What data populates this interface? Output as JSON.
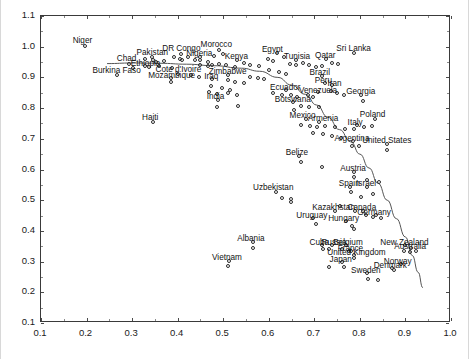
{
  "chart_data": {
    "type": "scatter",
    "title": "",
    "xlabel": "",
    "ylabel": "",
    "xlim": [
      0.1,
      1.0
    ],
    "ylim": [
      0.1,
      1.1
    ],
    "xticks": [
      0.1,
      0.2,
      0.3,
      0.4,
      0.5,
      0.6,
      0.7,
      0.8,
      0.9,
      1.0
    ],
    "xtick_labels": [
      "0.1",
      "0.2",
      "0.3",
      "0.4",
      "0.5",
      "0.6",
      "0.7",
      "0.8",
      "0.9",
      "1.0"
    ],
    "yticks": [
      0.1,
      0.2,
      0.3,
      0.4,
      0.5,
      0.6,
      0.7,
      0.8,
      0.9,
      1.0,
      1.1
    ],
    "ytick_labels": [
      "0.1",
      "0.2",
      "0.3",
      "0.4",
      "0.5",
      "0.6",
      "0.7",
      "0.8",
      "0.9",
      "1.0",
      "1.1"
    ],
    "grid": false,
    "legend": false,
    "marker": "open-circle",
    "marker_color": "#2b2b2b",
    "trend_line": {
      "present": true,
      "color": "#555555",
      "style": "smooth-loess",
      "points": [
        [
          0.245,
          0.945
        ],
        [
          0.3,
          0.947
        ],
        [
          0.36,
          0.946
        ],
        [
          0.42,
          0.943
        ],
        [
          0.48,
          0.938
        ],
        [
          0.54,
          0.93
        ],
        [
          0.58,
          0.92
        ],
        [
          0.62,
          0.9
        ],
        [
          0.65,
          0.875
        ],
        [
          0.68,
          0.845
        ],
        [
          0.705,
          0.81
        ],
        [
          0.73,
          0.77
        ],
        [
          0.755,
          0.73
        ],
        [
          0.78,
          0.69
        ],
        [
          0.8,
          0.65
        ],
        [
          0.82,
          0.605
        ],
        [
          0.84,
          0.555
        ],
        [
          0.86,
          0.5
        ],
        [
          0.88,
          0.44
        ],
        [
          0.9,
          0.38
        ],
        [
          0.915,
          0.32
        ],
        [
          0.928,
          0.265
        ],
        [
          0.938,
          0.215
        ]
      ]
    },
    "points": [
      {
        "label": "Niger",
        "x": 0.198,
        "y": 1.0,
        "label_dx": -13,
        "label_dy": -11
      },
      {
        "label": "Chad",
        "x": 0.295,
        "y": 0.94,
        "label_dx": -13,
        "label_dy": -11
      },
      {
        "label": "Pakistan",
        "x": 0.345,
        "y": 0.962,
        "label_dx": -16,
        "label_dy": -10
      },
      {
        "label": "DR Congo",
        "x": 0.41,
        "y": 0.972,
        "label_dx": -20,
        "label_dy": -11
      },
      {
        "label": "Morocco",
        "x": 0.492,
        "y": 0.985,
        "label_dx": -19,
        "label_dy": -11
      },
      {
        "label": "Nigeria",
        "x": 0.452,
        "y": 0.962,
        "label_dx": -15,
        "label_dy": -9
      },
      {
        "label": "Ethiopia",
        "x": 0.33,
        "y": 0.935,
        "label_dx": -15,
        "label_dy": -8
      },
      {
        "label": "Burkina Faso",
        "x": 0.268,
        "y": 0.903,
        "label_dx": -25,
        "label_dy": -10
      },
      {
        "label": "Cote d'Ivoire",
        "x": 0.404,
        "y": 0.908,
        "label_dx": -24,
        "label_dy": -10
      },
      {
        "label": "Mozambique",
        "x": 0.388,
        "y": 0.895,
        "label_dx": -24,
        "label_dy": -8
      },
      {
        "label": "Kenya",
        "x": 0.532,
        "y": 0.955,
        "label_dx": -13,
        "label_dy": -9
      },
      {
        "label": "Egypt",
        "x": 0.62,
        "y": 0.975,
        "label_dx": -16,
        "label_dy": -9
      },
      {
        "label": "Tunisia",
        "x": 0.662,
        "y": 0.952,
        "label_dx": -13,
        "label_dy": -9
      },
      {
        "label": "Qatar",
        "x": 0.728,
        "y": 0.958,
        "label_dx": -12,
        "label_dy": -9
      },
      {
        "label": "Sri Lanka",
        "x": 0.79,
        "y": 0.975,
        "label_dx": -19,
        "label_dy": -10
      },
      {
        "label": "Zimbabwe",
        "x": 0.512,
        "y": 0.905,
        "label_dx": -20,
        "label_dy": -9
      },
      {
        "label": "Iraq",
        "x": 0.478,
        "y": 0.893,
        "label_dx": -9,
        "label_dy": -8
      },
      {
        "label": "India",
        "x": 0.49,
        "y": 0.822,
        "label_dx": -12,
        "label_dy": -9
      },
      {
        "label": "Brazil",
        "x": 0.718,
        "y": 0.9,
        "label_dx": -13,
        "label_dy": -9
      },
      {
        "label": "Peru",
        "x": 0.725,
        "y": 0.88,
        "label_dx": -11,
        "label_dy": -8
      },
      {
        "label": "Iran",
        "x": 0.742,
        "y": 0.872,
        "label_dx": -6,
        "label_dy": -7
      },
      {
        "label": "Ecuador",
        "x": 0.64,
        "y": 0.855,
        "label_dx": -17,
        "label_dy": -8
      },
      {
        "label": "Venezuela",
        "x": 0.71,
        "y": 0.848,
        "label_dx": -20,
        "label_dy": -7
      },
      {
        "label": "Georgia",
        "x": 0.805,
        "y": 0.838,
        "label_dx": -16,
        "label_dy": -9
      },
      {
        "label": "Botswana",
        "x": 0.655,
        "y": 0.818,
        "label_dx": -19,
        "label_dy": -8
      },
      {
        "label": "Haiti",
        "x": 0.348,
        "y": 0.752,
        "label_dx": -12,
        "label_dy": -10
      },
      {
        "label": "Mexico",
        "x": 0.683,
        "y": 0.76,
        "label_dx": -17,
        "label_dy": -9
      },
      {
        "label": "Armenia",
        "x": 0.712,
        "y": 0.752,
        "label_dx": -12,
        "label_dy": -9
      },
      {
        "label": "Poland",
        "x": 0.835,
        "y": 0.762,
        "label_dx": -16,
        "label_dy": -10
      },
      {
        "label": "Italy",
        "x": 0.795,
        "y": 0.742,
        "label_dx": -10,
        "label_dy": -8
      },
      {
        "label": "Argentina",
        "x": 0.788,
        "y": 0.69,
        "label_dx": -20,
        "label_dy": -8
      },
      {
        "label": "United States",
        "x": 0.862,
        "y": 0.68,
        "label_dx": -26,
        "label_dy": -9
      },
      {
        "label": "Belize",
        "x": 0.668,
        "y": 0.64,
        "label_dx": -14,
        "label_dy": -9
      },
      {
        "label": "Austria",
        "x": 0.79,
        "y": 0.588,
        "label_dx": -15,
        "label_dy": -9
      },
      {
        "label": "Uzbekistan",
        "x": 0.618,
        "y": 0.522,
        "label_dx": -24,
        "label_dy": -10
      },
      {
        "label": "Spain",
        "x": 0.78,
        "y": 0.54,
        "label_dx": -12,
        "label_dy": -9
      },
      {
        "label": "Israel",
        "x": 0.818,
        "y": 0.54,
        "label_dx": -12,
        "label_dy": -9
      },
      {
        "label": "Kazakhstan",
        "x": 0.748,
        "y": 0.462,
        "label_dx": -24,
        "label_dy": -9
      },
      {
        "label": "Canada",
        "x": 0.808,
        "y": 0.462,
        "label_dx": -16,
        "label_dy": -9
      },
      {
        "label": "Germany",
        "x": 0.838,
        "y": 0.448,
        "label_dx": -20,
        "label_dy": -8
      },
      {
        "label": "Uruguay",
        "x": 0.7,
        "y": 0.438,
        "label_dx": -18,
        "label_dy": -8
      },
      {
        "label": "Hungary",
        "x": 0.772,
        "y": 0.428,
        "label_dx": -19,
        "label_dy": -8
      },
      {
        "label": "Albania",
        "x": 0.568,
        "y": 0.36,
        "label_dx": -17,
        "label_dy": -9
      },
      {
        "label": "Cuba",
        "x": 0.718,
        "y": 0.352,
        "label_dx": -13,
        "label_dy": -8
      },
      {
        "label": "Russia",
        "x": 0.742,
        "y": 0.35,
        "label_dx": -12,
        "label_dy": -8
      },
      {
        "label": "Belgium",
        "x": 0.772,
        "y": 0.352,
        "label_dx": -14,
        "label_dy": -8
      },
      {
        "label": "New Zealand",
        "x": 0.902,
        "y": 0.35,
        "label_dx": -26,
        "label_dy": -8
      },
      {
        "label": "Australia",
        "x": 0.915,
        "y": 0.34,
        "label_dx": -18,
        "label_dy": -7
      },
      {
        "label": "France",
        "x": 0.782,
        "y": 0.33,
        "label_dx": -14,
        "label_dy": -8
      },
      {
        "label": "Vietnam",
        "x": 0.515,
        "y": 0.3,
        "label_dx": -18,
        "label_dy": -9
      },
      {
        "label": "United Kingdom",
        "x": 0.79,
        "y": 0.318,
        "label_dx": -28,
        "label_dy": -8
      },
      {
        "label": "Japan",
        "x": 0.762,
        "y": 0.295,
        "label_dx": -13,
        "label_dy": -8
      },
      {
        "label": "Norway",
        "x": 0.892,
        "y": 0.288,
        "label_dx": -18,
        "label_dy": -8
      },
      {
        "label": "Denmark",
        "x": 0.872,
        "y": 0.275,
        "label_dx": -19,
        "label_dy": -8
      },
      {
        "label": "Sweden",
        "x": 0.818,
        "y": 0.258,
        "label_dx": -17,
        "label_dy": -8
      }
    ],
    "unlabeled_points": [
      [
        0.33,
        0.958
      ],
      [
        0.348,
        0.955
      ],
      [
        0.355,
        0.948
      ],
      [
        0.372,
        0.95
      ],
      [
        0.395,
        0.962
      ],
      [
        0.408,
        0.958
      ],
      [
        0.412,
        0.955
      ],
      [
        0.424,
        0.962
      ],
      [
        0.44,
        0.955
      ],
      [
        0.452,
        0.952
      ],
      [
        0.468,
        0.948
      ],
      [
        0.482,
        0.968
      ],
      [
        0.502,
        0.972
      ],
      [
        0.305,
        0.928
      ],
      [
        0.34,
        0.932
      ],
      [
        0.362,
        0.935
      ],
      [
        0.39,
        0.928
      ],
      [
        0.452,
        0.938
      ],
      [
        0.468,
        0.935
      ],
      [
        0.478,
        0.938
      ],
      [
        0.492,
        0.942
      ],
      [
        0.508,
        0.938
      ],
      [
        0.528,
        0.932
      ],
      [
        0.548,
        0.945
      ],
      [
        0.562,
        0.938
      ],
      [
        0.58,
        0.935
      ],
      [
        0.6,
        0.958
      ],
      [
        0.612,
        0.95
      ],
      [
        0.635,
        0.962
      ],
      [
        0.648,
        0.942
      ],
      [
        0.662,
        0.938
      ],
      [
        0.678,
        0.945
      ],
      [
        0.69,
        0.938
      ],
      [
        0.705,
        0.932
      ],
      [
        0.718,
        0.935
      ],
      [
        0.74,
        0.945
      ],
      [
        0.755,
        0.942
      ],
      [
        0.602,
        0.92
      ],
      [
        0.625,
        0.915
      ],
      [
        0.64,
        0.908
      ],
      [
        0.562,
        0.898
      ],
      [
        0.578,
        0.895
      ],
      [
        0.592,
        0.89
      ],
      [
        0.432,
        0.905
      ],
      [
        0.448,
        0.898
      ],
      [
        0.388,
        0.882
      ],
      [
        0.512,
        0.888
      ],
      [
        0.528,
        0.882
      ],
      [
        0.548,
        0.878
      ],
      [
        0.475,
        0.868
      ],
      [
        0.5,
        0.862
      ],
      [
        0.516,
        0.855
      ],
      [
        0.47,
        0.848
      ],
      [
        0.488,
        0.842
      ],
      [
        0.512,
        0.845
      ],
      [
        0.532,
        0.838
      ],
      [
        0.612,
        0.845
      ],
      [
        0.632,
        0.838
      ],
      [
        0.65,
        0.838
      ],
      [
        0.665,
        0.832
      ],
      [
        0.688,
        0.84
      ],
      [
        0.7,
        0.832
      ],
      [
        0.738,
        0.852
      ],
      [
        0.752,
        0.845
      ],
      [
        0.768,
        0.838
      ],
      [
        0.808,
        0.82
      ],
      [
        0.488,
        0.8
      ],
      [
        0.535,
        0.805
      ],
      [
        0.672,
        0.805
      ],
      [
        0.69,
        0.8
      ],
      [
        0.712,
        0.8
      ],
      [
        0.658,
        0.79
      ],
      [
        0.672,
        0.742
      ],
      [
        0.692,
        0.738
      ],
      [
        0.708,
        0.735
      ],
      [
        0.726,
        0.738
      ],
      [
        0.748,
        0.735
      ],
      [
        0.77,
        0.73
      ],
      [
        0.79,
        0.728
      ],
      [
        0.812,
        0.735
      ],
      [
        0.828,
        0.74
      ],
      [
        0.7,
        0.715
      ],
      [
        0.722,
        0.712
      ],
      [
        0.742,
        0.705
      ],
      [
        0.76,
        0.7
      ],
      [
        0.785,
        0.672
      ],
      [
        0.8,
        0.672
      ],
      [
        0.862,
        0.66
      ],
      [
        0.672,
        0.622
      ],
      [
        0.718,
        0.605
      ],
      [
        0.79,
        0.572
      ],
      [
        0.818,
        0.562
      ],
      [
        0.845,
        0.555
      ],
      [
        0.632,
        0.505
      ],
      [
        0.65,
        0.5
      ],
      [
        0.652,
        0.492
      ],
      [
        0.782,
        0.522
      ],
      [
        0.805,
        0.508
      ],
      [
        0.832,
        0.518
      ],
      [
        0.758,
        0.478
      ],
      [
        0.792,
        0.462
      ],
      [
        0.815,
        0.448
      ],
      [
        0.832,
        0.442
      ],
      [
        0.848,
        0.438
      ],
      [
        0.705,
        0.418
      ],
      [
        0.785,
        0.412
      ],
      [
        0.79,
        0.402
      ],
      [
        0.568,
        0.342
      ],
      [
        0.722,
        0.338
      ],
      [
        0.735,
        0.338
      ],
      [
        0.762,
        0.338
      ],
      [
        0.778,
        0.332
      ],
      [
        0.898,
        0.332
      ],
      [
        0.912,
        0.328
      ],
      [
        0.925,
        0.33
      ],
      [
        0.79,
        0.308
      ],
      [
        0.512,
        0.282
      ],
      [
        0.735,
        0.278
      ],
      [
        0.768,
        0.28
      ],
      [
        0.878,
        0.268
      ],
      [
        0.82,
        0.24
      ],
      [
        0.842,
        0.238
      ]
    ]
  }
}
